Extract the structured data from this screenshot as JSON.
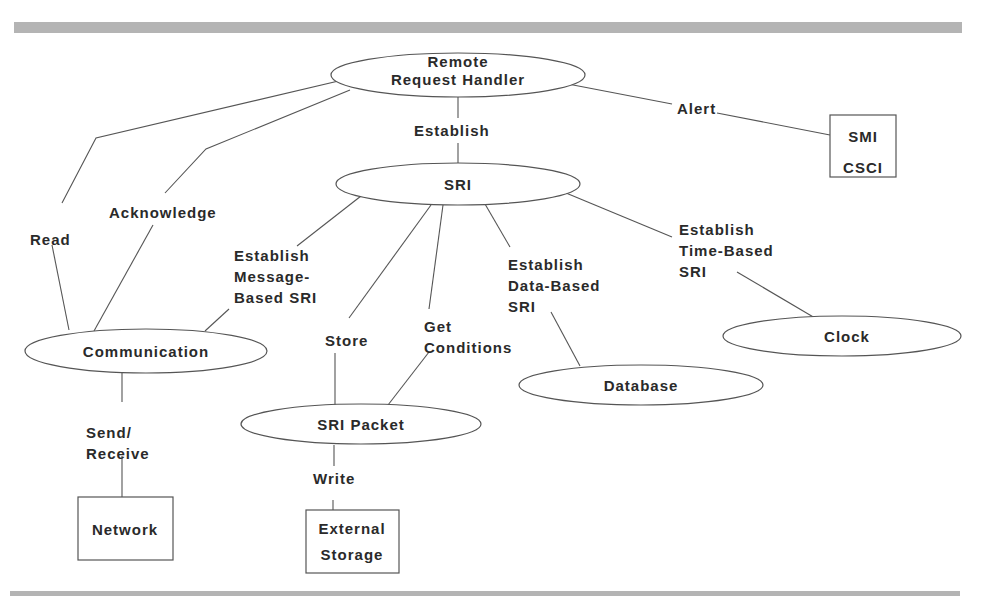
{
  "diagram": {
    "type": "context-diagram",
    "colors": {
      "stroke": "#555555",
      "text": "#2a2a2a",
      "rule": "#b4b4b4",
      "background": "#ffffff"
    },
    "rules": [
      {
        "id": "top-rule",
        "x": 14,
        "y": 22,
        "w": 948,
        "h": 11
      },
      {
        "id": "bottom-rule",
        "x": 10,
        "y": 591,
        "w": 950,
        "h": 5
      }
    ],
    "nodes": [
      {
        "id": "remote-request-handler",
        "shape": "ellipse",
        "cx": 458,
        "cy": 75,
        "rx": 127,
        "ry": 22,
        "lines": [
          "Remote",
          "Request Handler"
        ],
        "tx": 458,
        "ty": 53
      },
      {
        "id": "sri",
        "shape": "ellipse",
        "cx": 458,
        "cy": 184,
        "rx": 122,
        "ry": 21,
        "lines": [
          "SRI"
        ],
        "tx": 458,
        "ty": 174
      },
      {
        "id": "smi-csci",
        "shape": "rect",
        "x": 830,
        "y": 115,
        "w": 66,
        "h": 62,
        "lines": [
          "SMI",
          "CSCI"
        ],
        "tx": 863,
        "ty": 121
      },
      {
        "id": "communication",
        "shape": "ellipse",
        "cx": 146,
        "cy": 351,
        "rx": 121,
        "ry": 22,
        "lines": [
          "Communication"
        ],
        "tx": 146,
        "ty": 341
      },
      {
        "id": "sri-packet",
        "shape": "ellipse",
        "cx": 361,
        "cy": 424,
        "rx": 120,
        "ry": 20,
        "lines": [
          "SRI Packet"
        ],
        "tx": 361,
        "ty": 414
      },
      {
        "id": "database",
        "shape": "ellipse",
        "cx": 641,
        "cy": 385,
        "rx": 122,
        "ry": 20,
        "lines": [
          "Database"
        ],
        "tx": 641,
        "ty": 375
      },
      {
        "id": "clock",
        "shape": "ellipse",
        "cx": 842,
        "cy": 336,
        "rx": 119,
        "ry": 20,
        "lines": [
          "Clock"
        ],
        "tx": 847,
        "ty": 326
      },
      {
        "id": "network",
        "shape": "rect",
        "x": 78,
        "y": 497,
        "w": 95,
        "h": 63,
        "lines": [
          "Network"
        ],
        "tx": 125,
        "ty": 519
      },
      {
        "id": "external-storage",
        "shape": "rect",
        "x": 306,
        "y": 510,
        "w": 93,
        "h": 63,
        "lines": [
          "External",
          "Storage"
        ],
        "tx": 352,
        "ty": 516
      }
    ],
    "edges": [
      {
        "id": "read",
        "from": "remote-request-handler",
        "to": "communication",
        "label_lines": [
          "Read"
        ],
        "lx": 30,
        "ly": 229,
        "segments": [
          [
            [
              347,
              79
            ],
            [
              96,
              138
            ],
            [
              62,
              203
            ]
          ],
          [
            [
              52,
              245
            ],
            [
              69,
              330
            ]
          ]
        ]
      },
      {
        "id": "acknowledge",
        "from": "remote-request-handler",
        "to": "communication",
        "label_lines": [
          "Acknowledge"
        ],
        "lx": 109,
        "ly": 202,
        "segments": [
          [
            [
              350,
              90
            ],
            [
              206,
              149
            ],
            [
              165,
              193
            ]
          ],
          [
            [
              153,
              225
            ],
            [
              94,
              331
            ]
          ]
        ]
      },
      {
        "id": "establish",
        "from": "remote-request-handler",
        "to": "sri",
        "label_lines": [
          "Establish"
        ],
        "lx": 414,
        "ly": 120,
        "segments": [
          [
            [
              458,
              97
            ],
            [
              458,
              118
            ]
          ],
          [
            [
              458,
              143
            ],
            [
              458,
              163
            ]
          ]
        ]
      },
      {
        "id": "alert",
        "from": "remote-request-handler",
        "to": "smi-csci",
        "label_lines": [
          "Alert"
        ],
        "lx": 677,
        "ly": 98,
        "segments": [
          [
            [
              568,
              84
            ],
            [
              672,
              104
            ]
          ],
          [
            [
              717,
              113
            ],
            [
              830,
              135
            ]
          ]
        ]
      },
      {
        "id": "establish-message-based-sri",
        "from": "sri",
        "to": "communication",
        "label_lines": [
          "Establish",
          "Message-",
          "Based SRI"
        ],
        "lx": 234,
        "ly": 245,
        "segments": [
          [
            [
              361,
              196
            ],
            [
              297,
              246
            ]
          ],
          [
            [
              229,
              309
            ],
            [
              205,
              331
            ]
          ]
        ]
      },
      {
        "id": "store",
        "from": "sri",
        "to": "sri-packet",
        "label_lines": [
          "Store"
        ],
        "lx": 325,
        "ly": 330,
        "segments": [
          [
            [
              431,
              205
            ],
            [
              349,
              318
            ]
          ],
          [
            [
              335,
              353
            ],
            [
              335,
              405
            ]
          ]
        ]
      },
      {
        "id": "get-conditions",
        "from": "sri",
        "to": "sri-packet",
        "label_lines": [
          "Get",
          "Conditions"
        ],
        "lx": 424,
        "ly": 316,
        "segments": [
          [
            [
              443,
              205
            ],
            [
              429,
              309
            ]
          ],
          [
            [
              429,
              352
            ],
            [
              388,
              405
            ]
          ]
        ]
      },
      {
        "id": "establish-data-based-sri",
        "from": "sri",
        "to": "database",
        "label_lines": [
          "Establish",
          "Data-Based",
          "SRI"
        ],
        "lx": 508,
        "ly": 254,
        "segments": [
          [
            [
              485,
              204
            ],
            [
              510,
              247
            ]
          ],
          [
            [
              551,
              312
            ],
            [
              580,
              366
            ]
          ]
        ]
      },
      {
        "id": "establish-time-based-sri",
        "from": "sri",
        "to": "clock",
        "label_lines": [
          "Establish",
          "Time-Based",
          "SRI"
        ],
        "lx": 679,
        "ly": 219,
        "segments": [
          [
            [
              566,
              193
            ],
            [
              672,
              237
            ]
          ],
          [
            [
              737,
              272
            ],
            [
              815,
              318
            ]
          ]
        ]
      },
      {
        "id": "send-receive",
        "from": "communication",
        "to": "network",
        "label_lines": [
          "Send/",
          "Receive"
        ],
        "lx": 86,
        "ly": 422,
        "segments": [
          [
            [
              122,
              372
            ],
            [
              122,
              402
            ]
          ],
          [
            [
              122,
              456
            ],
            [
              122,
              497
            ]
          ]
        ]
      },
      {
        "id": "write",
        "from": "sri-packet",
        "to": "external-storage",
        "label_lines": [
          "Write"
        ],
        "lx": 313,
        "ly": 468,
        "segments": [
          [
            [
              334,
              445
            ],
            [
              334,
              466
            ]
          ],
          [
            [
              333,
              500
            ],
            [
              333,
              510
            ]
          ]
        ]
      }
    ]
  }
}
